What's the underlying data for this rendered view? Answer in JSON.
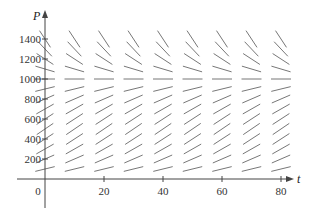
{
  "chart_data": {
    "type": "slope_field",
    "title": "",
    "xlabel": "t",
    "ylabel": "P",
    "xlim": [
      -10,
      90
    ],
    "ylim": [
      -100,
      1500
    ],
    "x_ticks": [
      0,
      20,
      40,
      60,
      80
    ],
    "x_tick_labels": [
      "0",
      "20",
      "40",
      "60",
      "80"
    ],
    "y_ticks": [
      200,
      400,
      600,
      800,
      1000,
      1200,
      1400
    ],
    "y_tick_labels": [
      "200",
      "400",
      "600",
      "800",
      "1000",
      "1200",
      "1400"
    ],
    "grid": false,
    "legend": null,
    "equation": "dP/dt = kP(1 - P/1000)",
    "equilibrium": 1000,
    "sample_t": [
      0,
      10,
      20,
      30,
      40,
      50,
      60,
      70,
      80
    ],
    "sample_P": [
      100,
      200,
      300,
      400,
      500,
      600,
      700,
      800,
      900,
      1000,
      1100,
      1200,
      1300,
      1400
    ]
  },
  "colors": {
    "axis": "#444444",
    "segment": "#777777",
    "text": "#333333"
  }
}
